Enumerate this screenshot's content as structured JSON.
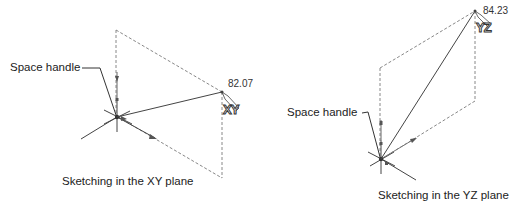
{
  "figures": [
    {
      "id": "xy",
      "leader_label": "Space handle",
      "dimension_value": "82.07",
      "plane_tag": "XY",
      "caption": "Sketching in the XY plane"
    },
    {
      "id": "yz",
      "leader_label": "Space handle",
      "dimension_value": "84.23",
      "plane_tag": "YZ",
      "caption": "Sketching in the YZ plane"
    }
  ],
  "colors": {
    "line": "#444444",
    "dashed": "#888888",
    "text": "#222222"
  }
}
